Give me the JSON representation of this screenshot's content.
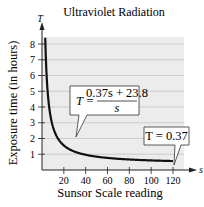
{
  "chart_data": {
    "type": "line",
    "title": "Ultraviolet Radiation",
    "xlabel": "Sunsor Scale reading",
    "ylabel": "Exposure time (in hours)",
    "x_axis_var": "s",
    "y_axis_var": "T",
    "xlim": [
      0,
      130
    ],
    "ylim": [
      0,
      8.6
    ],
    "x_ticks": [
      20,
      40,
      60,
      80,
      100,
      120
    ],
    "y_ticks": [
      1,
      2,
      3,
      4,
      5,
      6,
      7,
      8
    ],
    "grid": "horizontal",
    "series": [
      {
        "name": "T = (0.37s + 23.8)/s",
        "x": [
          3,
          4,
          5,
          6,
          8,
          10,
          12,
          15,
          20,
          25,
          30,
          40,
          50,
          60,
          70,
          80,
          90,
          100,
          110,
          120
        ],
        "values": [
          8.3,
          6.32,
          5.13,
          4.34,
          3.35,
          2.75,
          2.35,
          1.96,
          1.56,
          1.32,
          1.16,
          0.97,
          0.85,
          0.77,
          0.71,
          0.67,
          0.63,
          0.61,
          0.59,
          0.57
        ]
      }
    ],
    "annotations": [
      {
        "text_lhs": "T =",
        "numerator": "0.37s + 23.8",
        "denominator": "s",
        "points_to": [
          12,
          2.35
        ]
      },
      {
        "text": "T = 0.37",
        "points_to": [
          120,
          0.57
        ]
      }
    ],
    "colors": {
      "plot_bg": "#ececec",
      "grid": "#b8b8b8",
      "curve": "#111111",
      "axis": "#222222"
    }
  }
}
